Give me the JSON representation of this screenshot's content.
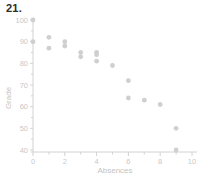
{
  "problem": {
    "number": "21."
  },
  "chart_data": {
    "type": "scatter",
    "title": "",
    "xlabel": "Absences",
    "ylabel": "Grade",
    "xlim": [
      0,
      10
    ],
    "ylim": [
      40,
      100
    ],
    "xticks": [
      0,
      2,
      4,
      6,
      8,
      10
    ],
    "xtick_labels": [
      "0",
      "2",
      "4",
      "6",
      "8",
      "10"
    ],
    "xminor_ticks": [
      1,
      3,
      5,
      7,
      9
    ],
    "yticks": [
      40,
      50,
      60,
      70,
      80,
      90,
      100
    ],
    "ytick_labels": [
      "40",
      "50",
      "60",
      "70",
      "80",
      "90",
      "100"
    ],
    "grid": false,
    "legend": null,
    "marker_color": "#cfcfcf",
    "axis_color": "#d2d2d2",
    "label_color": "#c8c8c8",
    "points": [
      {
        "x": 0,
        "y": 100
      },
      {
        "x": 0,
        "y": 90
      },
      {
        "x": 1,
        "y": 92
      },
      {
        "x": 1,
        "y": 87
      },
      {
        "x": 2,
        "y": 90
      },
      {
        "x": 2,
        "y": 88
      },
      {
        "x": 3,
        "y": 85
      },
      {
        "x": 3,
        "y": 83
      },
      {
        "x": 4,
        "y": 85
      },
      {
        "x": 4,
        "y": 84
      },
      {
        "x": 4,
        "y": 81
      },
      {
        "x": 5,
        "y": 79
      },
      {
        "x": 6,
        "y": 72
      },
      {
        "x": 6,
        "y": 64
      },
      {
        "x": 7,
        "y": 63
      },
      {
        "x": 8,
        "y": 61
      },
      {
        "x": 9,
        "y": 50
      },
      {
        "x": 9,
        "y": 40
      }
    ]
  }
}
